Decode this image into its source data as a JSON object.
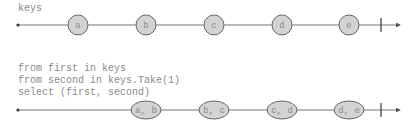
{
  "diagram": {
    "type": "marble-diagram",
    "top": {
      "label": "keys",
      "marbles": [
        {
          "value": "a",
          "x": 78
        },
        {
          "value": "b",
          "x": 146
        },
        {
          "value": "c",
          "x": 214
        },
        {
          "value": "d",
          "x": 282
        },
        {
          "value": "e",
          "x": 349
        }
      ]
    },
    "bottom": {
      "query_lines": [
        "from first in keys",
        "from second in keys.Take(1)",
        "select (first, second)"
      ],
      "marbles": [
        {
          "value": "a, b",
          "x": 146
        },
        {
          "value": "b, c",
          "x": 214
        },
        {
          "value": "c, d",
          "x": 282
        },
        {
          "value": "d, e",
          "x": 349
        }
      ]
    },
    "colors": {
      "line": "#555555",
      "marble_fill": "#d3d3d3",
      "marble_stroke": "#666666",
      "text": "#8a8a8a"
    }
  }
}
